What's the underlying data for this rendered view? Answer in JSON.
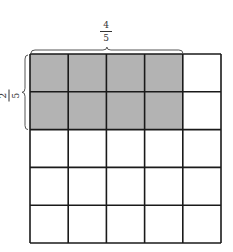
{
  "diagram": {
    "type": "fraction-area-model",
    "grid": {
      "rows": 5,
      "cols": 5,
      "shaded_rows": 2,
      "shaded_cols": 4
    },
    "colors": {
      "shaded": "#b3b3b3",
      "unshaded": "#ffffff",
      "line": "#1a1a1a",
      "brace": "#555555"
    },
    "top_label": {
      "numerator": "4",
      "denominator": "5"
    },
    "left_label": {
      "numerator": "2",
      "denominator": "5"
    }
  }
}
